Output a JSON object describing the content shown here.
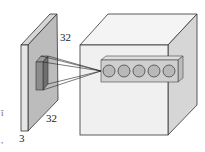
{
  "diagram": {
    "input_volume": {
      "width_label": "32",
      "height_label": "32",
      "depth_label": "3"
    },
    "output_volume": {
      "neuron_count": 5
    },
    "colors": {
      "input_face": "#e4e4e4",
      "input_side": "#b9b9b9",
      "input_top": "#d6d6d6",
      "receptive_field": "#8a8a8a",
      "cube_front": "#f0f0f0",
      "cube_side": "#d2d2d2",
      "cube_top": "#f4f4f4",
      "neuron_box": "#cfcfcf",
      "neuron_fill": "#b5b5b5",
      "stroke": "#333333"
    },
    "margin_marks": {
      "left_mark": "ǐ",
      "bottom_mark": ","
    }
  }
}
